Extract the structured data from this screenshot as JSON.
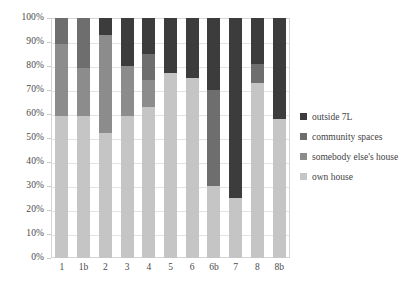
{
  "chart_data": {
    "type": "bar",
    "stacked": true,
    "normalized_percent": true,
    "title": "",
    "xlabel": "",
    "ylabel": "",
    "ylim": [
      0,
      100
    ],
    "ytick_labels": [
      "100%",
      "90%",
      "80%",
      "70%",
      "60%",
      "50%",
      "40%",
      "30%",
      "20%",
      "10%",
      "0%"
    ],
    "ytick_values": [
      100,
      90,
      80,
      70,
      60,
      50,
      40,
      30,
      20,
      10,
      0
    ],
    "grid": true,
    "legend_position": "right",
    "categories": [
      "1",
      "1b",
      "2",
      "3",
      "4",
      "5",
      "6",
      "6b",
      "7",
      "8",
      "8b"
    ],
    "series": [
      {
        "name": "own house",
        "color": "#c5c5c5",
        "values": [
          59,
          59,
          52,
          59,
          63,
          77,
          75,
          30,
          25,
          73,
          58
        ]
      },
      {
        "name": "somebody else's house",
        "color": "#8c8c8c",
        "values": [
          30,
          20,
          41,
          21,
          11,
          0,
          0,
          0,
          0,
          0,
          0
        ]
      },
      {
        "name": "community spaces",
        "color": "#6e6e6e",
        "values": [
          11,
          21,
          0,
          0,
          11,
          0,
          0,
          40,
          0,
          8,
          0
        ]
      },
      {
        "name": "outside 7L",
        "color": "#3c3c3c",
        "values": [
          0,
          0,
          7,
          20,
          15,
          23,
          25,
          30,
          75,
          19,
          42
        ]
      }
    ]
  },
  "legend": {
    "items": [
      {
        "label": "outside 7L",
        "color": "#3c3c3c"
      },
      {
        "label": "community spaces",
        "color": "#6e6e6e"
      },
      {
        "label": "somebody else's house",
        "color": "#8c8c8c"
      },
      {
        "label": "own house",
        "color": "#c5c5c5"
      }
    ]
  }
}
